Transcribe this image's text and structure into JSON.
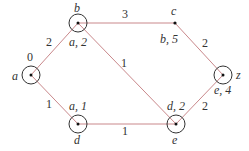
{
  "diagram": {
    "type": "weighted-graph-dijkstra",
    "colors": {
      "edge": "#c9888b",
      "node": "#333333",
      "text": "#333333"
    },
    "nodes": [
      {
        "id": "a",
        "x": 31,
        "y": 75,
        "circled": true,
        "name": "a",
        "label": "0"
      },
      {
        "id": "b",
        "x": 78,
        "y": 23,
        "circled": true,
        "name": "b",
        "label": "a, 2"
      },
      {
        "id": "c",
        "x": 175,
        "y": 23,
        "circled": false,
        "name": "c",
        "label": "b, 5"
      },
      {
        "id": "z",
        "x": 223,
        "y": 75,
        "circled": true,
        "name": "z",
        "label": "e, 4"
      },
      {
        "id": "d",
        "x": 78,
        "y": 124,
        "circled": true,
        "name": "d",
        "label": "a, 1"
      },
      {
        "id": "e",
        "x": 176,
        "y": 124,
        "circled": true,
        "name": "e",
        "label": "d, 2"
      }
    ],
    "edges": [
      {
        "from": "a",
        "to": "b",
        "weight": "2"
      },
      {
        "from": "b",
        "to": "c",
        "weight": "3"
      },
      {
        "from": "b",
        "to": "e",
        "weight": "1"
      },
      {
        "from": "c",
        "to": "z",
        "weight": "2"
      },
      {
        "from": "a",
        "to": "d",
        "weight": "1"
      },
      {
        "from": "d",
        "to": "e",
        "weight": "1"
      },
      {
        "from": "e",
        "to": "z",
        "weight": "2"
      }
    ]
  }
}
